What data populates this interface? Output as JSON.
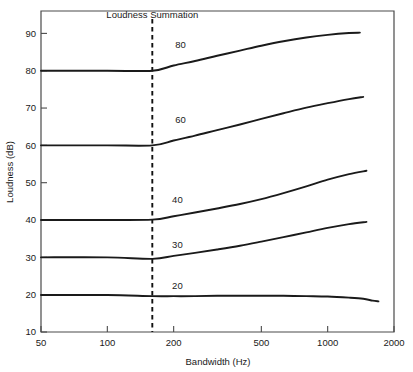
{
  "chart_data": {
    "type": "line",
    "title": "",
    "xlabel": "Bandwidth (Hz)",
    "ylabel": "Loudness (dB)",
    "xscale": "log",
    "xlim": [
      50,
      2000
    ],
    "ylim": [
      10,
      96
    ],
    "xticks": [
      50,
      100,
      200,
      500,
      1000,
      2000
    ],
    "xtick_labels": [
      "50",
      "100",
      "200",
      "500",
      "1000",
      "2000"
    ],
    "yticks": [
      10,
      20,
      30,
      40,
      50,
      60,
      70,
      80,
      90
    ],
    "ytick_labels": [
      "10",
      "20",
      "30",
      "40",
      "50",
      "60",
      "70",
      "80",
      "90"
    ],
    "grid": false,
    "legend": "none",
    "annotations": [
      {
        "name": "loudness-summation-label",
        "text": "Loudness Summation",
        "x": 160,
        "y": 94
      }
    ],
    "reference_lines": [
      {
        "name": "critical-band-marker",
        "orientation": "vertical",
        "x": 160,
        "style": "dashed"
      }
    ],
    "series": [
      {
        "name": "80",
        "label": "80",
        "label_x": 215,
        "label_y": 87,
        "x": [
          50,
          100,
          160,
          200,
          250,
          315,
          400,
          500,
          630,
          800,
          1000,
          1250,
          1400
        ],
        "y": [
          80.0,
          80.0,
          80.0,
          81.4,
          82.6,
          84.0,
          85.4,
          86.7,
          87.9,
          88.9,
          89.6,
          90.1,
          90.2
        ]
      },
      {
        "name": "60",
        "label": "60",
        "label_x": 215,
        "label_y": 67,
        "x": [
          50,
          100,
          160,
          200,
          250,
          315,
          400,
          500,
          630,
          800,
          1000,
          1250,
          1450
        ],
        "y": [
          60.0,
          60.0,
          60.0,
          61.3,
          62.6,
          64.1,
          65.6,
          67.1,
          68.6,
          70.1,
          71.3,
          72.4,
          73.0
        ]
      },
      {
        "name": "40",
        "label": "40",
        "label_x": 208,
        "label_y": 45.5,
        "x": [
          50,
          100,
          160,
          200,
          250,
          315,
          400,
          500,
          630,
          800,
          1000,
          1250,
          1500
        ],
        "y": [
          40.0,
          40.0,
          40.1,
          41.0,
          42.0,
          43.1,
          44.3,
          45.6,
          47.2,
          49.0,
          50.8,
          52.3,
          53.2
        ]
      },
      {
        "name": "30",
        "label": "30",
        "label_x": 208,
        "label_y": 33.5,
        "x": [
          50,
          100,
          160,
          200,
          250,
          315,
          400,
          500,
          630,
          800,
          1000,
          1250,
          1500
        ],
        "y": [
          30.0,
          30.0,
          29.6,
          30.4,
          31.2,
          32.1,
          33.1,
          34.2,
          35.4,
          36.7,
          37.9,
          38.9,
          39.5
        ]
      },
      {
        "name": "20",
        "label": "20",
        "label_x": 208,
        "label_y": 22.5,
        "x": [
          50,
          100,
          160,
          200,
          250,
          315,
          400,
          500,
          630,
          800,
          1000,
          1250,
          1450,
          1600,
          1700
        ],
        "y": [
          19.9,
          19.9,
          19.6,
          19.6,
          19.6,
          19.7,
          19.7,
          19.7,
          19.7,
          19.6,
          19.5,
          19.2,
          18.9,
          18.4,
          18.2
        ]
      }
    ]
  },
  "colors": {
    "curve": "#1a1a1a",
    "axis": "#4a4a4a",
    "background": "#ffffff",
    "marker": "#111111"
  }
}
